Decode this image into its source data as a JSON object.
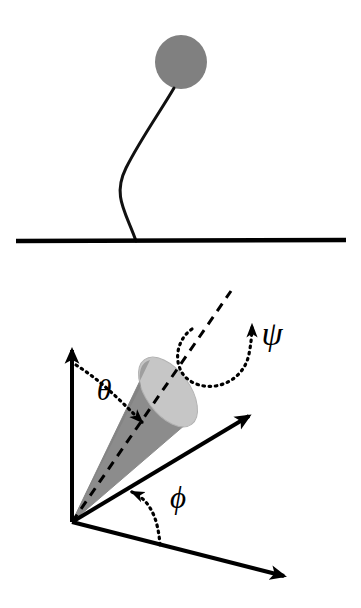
{
  "figure": {
    "background_color": "#ffffff",
    "width": 361,
    "height": 608
  },
  "panel_top": {
    "name": "tethered-sphere-panel",
    "description": "A gray sphere attached by a wavy flexible filament to a horizontal solid baseline",
    "sphere": {
      "label": "sphere",
      "fill_color": "#808080",
      "center_x": 181,
      "center_y": 62,
      "radius_x": 26,
      "radius_y": 27
    },
    "filament": {
      "label": "wavy-tether",
      "stroke_color": "#111111",
      "stroke_width": 3,
      "path": "M 174 88 C 160 112 140 140 126 168 C 112 196 126 212 136 241"
    },
    "baseline": {
      "label": "ground-line",
      "stroke_color": "#000000",
      "stroke_width": 4.5,
      "x1": 16,
      "y1": 241,
      "x2": 346,
      "y2": 240
    }
  },
  "panel_bottom": {
    "name": "euler-angle-cone-panel",
    "description": "Three-axis coordinate frame at an origin with a shaded cone whose symmetry axis is shown dashed; polar angle theta, azimuthal angle phi, and spin angle psi are marked with dotted arcs and arrowheads",
    "origin": {
      "x": 72,
      "y": 522
    },
    "axes": [
      {
        "name": "vertical-axis",
        "from_x": 72,
        "from_y": 522,
        "to_x": 72,
        "to_y": 347,
        "stroke_color": "#000000",
        "stroke_width": 4
      },
      {
        "name": "upper-right-axis",
        "from_x": 72,
        "from_y": 522,
        "to_x": 252,
        "to_y": 414,
        "stroke_color": "#000000",
        "stroke_width": 4
      },
      {
        "name": "lower-right-axis",
        "from_x": 72,
        "from_y": 522,
        "to_x": 287,
        "to_y": 577,
        "stroke_color": "#000000",
        "stroke_width": 4
      }
    ],
    "cone": {
      "label": "shaded-cone",
      "body_fill": "#8c8c8c",
      "body_stroke": "#8c8c8c",
      "cap_fill": "#c6c6c6",
      "cap_stroke": "#aaaaaa",
      "apex_x": 72,
      "apex_y": 522,
      "cap_center_x": 168,
      "cap_center_y": 392,
      "cap_rx": 22,
      "cap_ry": 40,
      "cap_rotation_deg": -36
    },
    "cone_axis": {
      "label": "cone-symmetry-axis-dashed",
      "stroke_color": "#000000",
      "stroke_width": 3,
      "dash": "9 7",
      "from_x": 72,
      "from_y": 522,
      "to_x": 231,
      "to_y": 291
    },
    "angles": [
      {
        "name": "theta",
        "symbol": "θ",
        "meaning": "polar angle between vertical axis and cone axis",
        "label_x": 104,
        "label_y": 400,
        "font_size": 30,
        "arc_color": "#000000",
        "arc_dash": "1.5 4.5",
        "arc_width": 3.2
      },
      {
        "name": "phi",
        "symbol": "ϕ",
        "meaning": "azimuthal angle in the base plane between the two right-hand axes",
        "label_x": 178,
        "label_y": 508,
        "font_size": 30,
        "arc_color": "#000000",
        "arc_dash": "1.5 4.5",
        "arc_width": 3.2
      },
      {
        "name": "psi",
        "symbol": "ψ",
        "meaning": "spin angle about the cone symmetry axis",
        "label_x": 259,
        "label_y": 345,
        "font_size": 34,
        "arc_color": "#000000",
        "arc_dash": "1.5 4.5",
        "arc_width": 3.2
      }
    ]
  }
}
